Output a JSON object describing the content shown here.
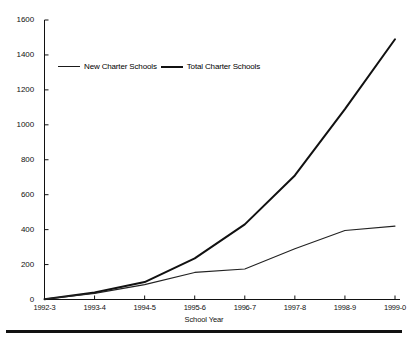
{
  "chart_data": {
    "type": "line",
    "title": "",
    "xlabel": "School Year",
    "ylabel": "",
    "categories": [
      "1992-3",
      "1993-4",
      "1994-5",
      "1995-6",
      "1996-7",
      "1997-8",
      "1998-9",
      "1999-0"
    ],
    "series": [
      {
        "name": "New Charter Schools",
        "values": [
          2,
          35,
          85,
          155,
          175,
          290,
          395,
          420
        ]
      },
      {
        "name": "Total Charter Schools",
        "values": [
          2,
          40,
          100,
          235,
          430,
          710,
          1090,
          1490
        ]
      }
    ],
    "ylim": [
      0,
      1600
    ],
    "yticks": [
      0,
      200,
      400,
      600,
      800,
      1000,
      1200,
      1400,
      1600
    ],
    "grid": false,
    "legend_position": "upper-left-inside",
    "legend": [
      "New Charter Schools",
      "Total Charter Schools"
    ]
  },
  "axis": {
    "y_tick_labels": [
      "1600",
      "1400",
      "1200",
      "1000",
      "800",
      "600",
      "400",
      "200",
      "0"
    ],
    "x_tick_labels": [
      "1992-3",
      "1993-4",
      "1994-5",
      "1995-6",
      "1996-7",
      "1997-8",
      "1998-9",
      "1999-0"
    ],
    "x_title": "School Year"
  },
  "legend": {
    "new_label": "New Charter Schools",
    "total_label": "Total Charter Schools"
  },
  "colors": {
    "line": "#111111",
    "axis": "#111111",
    "background": "#ffffff"
  }
}
